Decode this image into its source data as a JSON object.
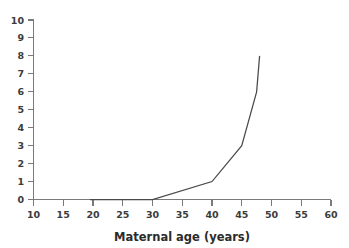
{
  "chart_data": {
    "type": "line",
    "title": "",
    "xlabel": "Maternal age (years)",
    "ylabel": "",
    "xlim": [
      10,
      60
    ],
    "ylim": [
      0,
      10
    ],
    "xticks": [
      10,
      15,
      20,
      25,
      30,
      35,
      40,
      45,
      50,
      55,
      60
    ],
    "yticks": [
      0,
      1,
      2,
      3,
      4,
      5,
      6,
      7,
      8,
      9,
      10
    ],
    "xtick_labels": [
      "10",
      "15",
      "20",
      "25",
      "30",
      "35",
      "40",
      "45",
      "50",
      "55",
      "60"
    ],
    "ytick_labels": [
      "0",
      "1",
      "2",
      "3",
      "4",
      "5",
      "6",
      "7",
      "8",
      "9",
      "10"
    ],
    "grid": false,
    "legend": false,
    "series": [
      {
        "name": "risk",
        "x": [
          19.5,
          30,
          40,
          45,
          47.5,
          48
        ],
        "values": [
          0,
          0,
          1,
          3,
          6,
          8
        ],
        "color": "#4a4a4a"
      }
    ],
    "axis_color": "#7a7a7a",
    "label_color": "#3b3b3b",
    "background": "#ffffff"
  }
}
